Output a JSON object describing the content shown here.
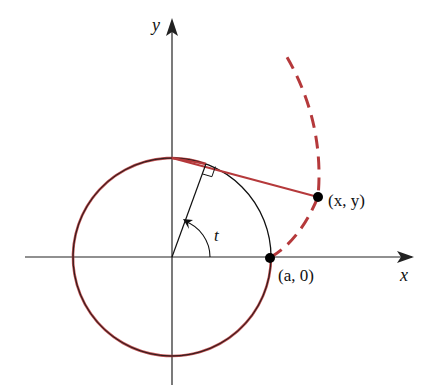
{
  "figure": {
    "labels": {
      "x_axis": "x",
      "y_axis": "y",
      "angle": "t",
      "point_moving": "(x, y)",
      "point_start": "(a, 0)"
    },
    "colors": {
      "axis": "#222222",
      "circle": "#111111",
      "string": "#b5393b",
      "point": "#000000"
    },
    "geometry": {
      "center": [
        172,
        257
      ],
      "radius": 99,
      "angle_t_degrees": 70
    }
  }
}
